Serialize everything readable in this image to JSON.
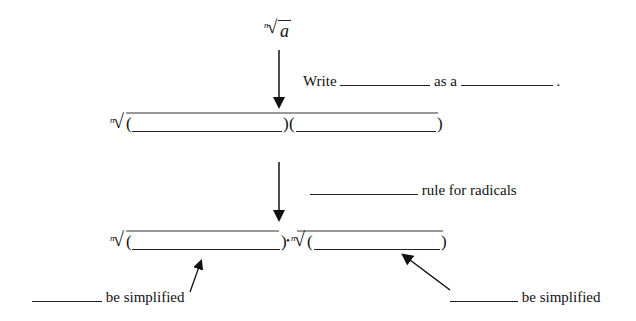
{
  "top_expression": {
    "index": "n",
    "radicand": "a"
  },
  "step1": {
    "prefix": "Write",
    "middle": "as a",
    "suffix": "."
  },
  "middle_expression": {
    "index": "n",
    "open1": "(",
    "close1": ")",
    "open2": "(",
    "close2": ")"
  },
  "step2": {
    "suffix": "rule for radicals"
  },
  "bottom_expression": {
    "index": "n",
    "open1": "(",
    "close1": ")",
    "dot": "•",
    "index2": "n",
    "open2": "(",
    "close2": ")"
  },
  "left_label": {
    "suffix": "be simplified"
  },
  "right_label": {
    "suffix": "be simplified"
  },
  "colors": {
    "ink": "#111111",
    "background": "#ffffff"
  }
}
